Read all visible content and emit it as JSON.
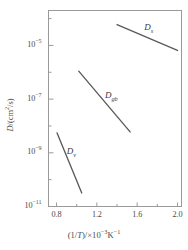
{
  "chart_data": {
    "type": "line",
    "title": "",
    "subtitle": "",
    "xlabel": "(1/T)/×10⁻³K⁻¹",
    "ylabel": "D/(cm²/s)",
    "xlabel_parts": {
      "lead": "(1/",
      "var": "T",
      "mid": ")/×10",
      "exp1": "−3",
      "unit": "K",
      "exp2": "−1"
    },
    "ylabel_parts": {
      "var": "D",
      "mid": "/(cm",
      "exp": "2",
      "tail": "/s)"
    },
    "xscale": "linear",
    "yscale": "log",
    "xlim": [
      0.72,
      2.04
    ],
    "ylim": [
      1e-11,
      0.0002
    ],
    "grid": false,
    "legend": "inline-labels",
    "xticks": [
      0.8,
      1.2,
      1.6,
      2.0
    ],
    "xtick_labels": [
      "0.8",
      "1.2",
      "1.6",
      "2.0"
    ],
    "x_minor_ticks": [
      1.0,
      1.4,
      1.8
    ],
    "yticks": [
      1e-05,
      1e-07,
      1e-09,
      1e-11
    ],
    "ytick_labels": [
      "10−5",
      "10−7",
      "10−9",
      "10−11"
    ],
    "ytick_mantissa": "10",
    "ytick_exponents": [
      "−5",
      "−7",
      "−9",
      "−11"
    ],
    "y_minor_exponents": [
      "−4",
      "−6",
      "−8",
      "−10"
    ],
    "series": [
      {
        "name": "D_s",
        "label": "D",
        "sub": "s",
        "description": "surface diffusion",
        "color": "#5a5a5a",
        "x": [
          1.4,
          2.0
        ],
        "y": [
          6e-05,
          6.5e-06
        ],
        "label_x": 1.72,
        "label_y": 4.5e-05
      },
      {
        "name": "D_gb",
        "label": "D",
        "sub": "gb",
        "description": "grain boundary diffusion",
        "color": "#5a5a5a",
        "x": [
          1.02,
          1.53
        ],
        "y": [
          1.1e-06,
          6e-09
        ],
        "label_x": 1.33,
        "label_y": 1.3e-07
      },
      {
        "name": "D_v",
        "label": "D",
        "sub": "v",
        "description": "volume (lattice) diffusion",
        "color": "#5a5a5a",
        "x": [
          0.805,
          1.05
        ],
        "y": [
          5.5e-09,
          3.2e-11
        ],
        "label_x": 0.95,
        "label_y": 1.1e-09
      }
    ]
  },
  "figure": {
    "frame_color": "#9a9a9a",
    "line_color": "#555555",
    "text_color": "#4a4a4a",
    "background": "#ffffff"
  }
}
